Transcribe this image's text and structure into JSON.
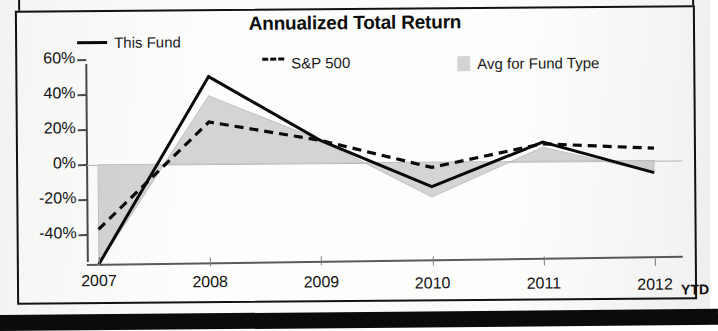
{
  "chart_data": {
    "type": "line",
    "title": "Annualized Total Return",
    "xlabel": "",
    "ylabel": "",
    "categories": [
      "2007",
      "2008",
      "2009",
      "2010",
      "2011",
      "2012"
    ],
    "x_axis_note": "YTD",
    "ytick_labels": [
      "60%",
      "40%",
      "20%",
      "0%",
      "-20%",
      "-40%"
    ],
    "ytick_values": [
      60,
      40,
      20,
      0,
      -20,
      -40
    ],
    "ylim": [
      -58,
      60
    ],
    "grid": false,
    "legend_position": "top",
    "series": [
      {
        "name": "This Fund",
        "style": "solid",
        "color": "#0a0a0a",
        "values": [
          -57,
          50,
          13,
          -14,
          11,
          -7
        ]
      },
      {
        "name": "S&P 500",
        "style": "dashed",
        "color": "#0a0a0a",
        "values": [
          -37,
          24,
          13,
          -3,
          10,
          7
        ]
      },
      {
        "name": "Avg for Fund Type",
        "style": "area",
        "color": "#d4d4d4",
        "values": [
          -57,
          39,
          13,
          -20,
          8,
          -7
        ]
      }
    ]
  },
  "chart": {
    "title": "Annualized Total Return",
    "legend": [
      {
        "label": "This Fund",
        "marker": "solid-line-swatch"
      },
      {
        "label": "S&P 500",
        "marker": "dashed-line-swatch"
      },
      {
        "label": "Avg for Fund Type",
        "marker": "gray-box-swatch"
      }
    ],
    "y_axis": {
      "labels": [
        "60%",
        "40%",
        "20%",
        "0%",
        "-20%",
        "-40%"
      ]
    },
    "x_axis": {
      "labels": [
        "2007",
        "2008",
        "2009",
        "2010",
        "2011",
        "2012"
      ],
      "suffix": "YTD"
    },
    "colors": {
      "line": "#0a0a0a",
      "area": "#d4d4d4",
      "axis": "#4a4a4a",
      "frame": "#121212"
    }
  }
}
